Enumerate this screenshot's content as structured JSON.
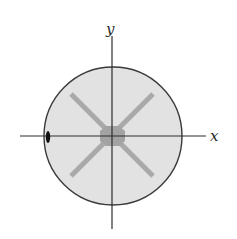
{
  "diagram": {
    "axes": {
      "x_label": "x",
      "y_label": "y"
    },
    "colors": {
      "background": "#ffffff",
      "disk_fill": "#e2e2e2",
      "disk_outline": "#3a3a3a",
      "axis_line": "#2e2e2e",
      "cross_arms": "#a9a9a9",
      "center_blob": "#a3a3a3",
      "edge_marker": "#111111"
    },
    "elements": [
      {
        "name": "disk",
        "description": "shaded circular region centered at origin"
      },
      {
        "name": "cross-arms",
        "description": "two gray diagonal bars forming an X through the center"
      },
      {
        "name": "center-blob",
        "description": "darker gray blob at the origin"
      },
      {
        "name": "edge-marker",
        "description": "small black elliptical marker on the left edge of the disk on the x-axis"
      }
    ]
  }
}
